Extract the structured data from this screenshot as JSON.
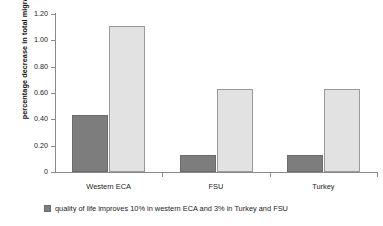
{
  "chart_data": {
    "type": "bar",
    "title": "",
    "xlabel": "",
    "ylabel": "percentage decrease in total migration",
    "categories": [
      "Western ECA",
      "FSU",
      "Turkey"
    ],
    "series": [
      {
        "name": "quality of life improves 10% in western ECA and 3% in Turkey and FSU",
        "color": "#7d7d7d",
        "values": [
          0.43,
          0.13,
          0.13
        ]
      },
      {
        "name": "",
        "color": "#e2e2e2",
        "values": [
          1.11,
          0.63,
          0.63
        ]
      }
    ],
    "ylim": [
      0,
      1.2
    ],
    "yticks": [
      "0",
      "0.20",
      "0.40",
      "0.60",
      "0.80",
      "1.00",
      "1.20"
    ],
    "ytick_values": [
      0,
      0.2,
      0.4,
      0.6,
      0.8,
      1.0,
      1.2
    ],
    "grid": false,
    "legend_position": "bottom-left"
  },
  "legend": {
    "items": [
      {
        "label": "quality of life improves 10% in western ECA and 3% in Turkey and FSU",
        "color": "#7d7d7d"
      }
    ]
  }
}
